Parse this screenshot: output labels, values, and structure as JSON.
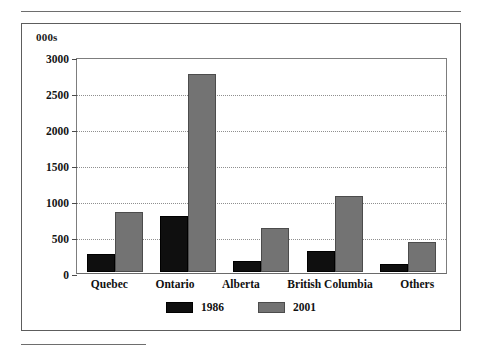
{
  "chart_data": {
    "type": "bar",
    "title": "",
    "subtitle": "",
    "xlabel": "",
    "ylabel": "000s",
    "unit_caption": "000s",
    "categories": [
      "Quebec",
      "Ontario",
      "Alberta",
      "British Columbia",
      "Others"
    ],
    "series": [
      {
        "name": "1986",
        "color": "#0f0f0f",
        "values": [
          250,
          790,
          160,
          300,
          110
        ]
      },
      {
        "name": "2001",
        "color": "#737373",
        "values": [
          840,
          2770,
          620,
          1070,
          420
        ]
      }
    ],
    "ylim": [
      0,
      3000
    ],
    "yticks": [
      0,
      500,
      1000,
      1500,
      2000,
      2500,
      3000
    ],
    "ytick_labels": [
      "0",
      "500",
      "1000",
      "1500",
      "2000",
      "2500",
      "3000"
    ],
    "grid": true,
    "grid_style": "dotted-horizontal",
    "legend": [
      "1986",
      "2001"
    ],
    "legend_position": "bottom-center",
    "bar_group_mode": "grouped-adjacent"
  },
  "figure": {
    "frame_visible": true,
    "rule_top_visible": true,
    "rule_bottom_visible": true
  }
}
